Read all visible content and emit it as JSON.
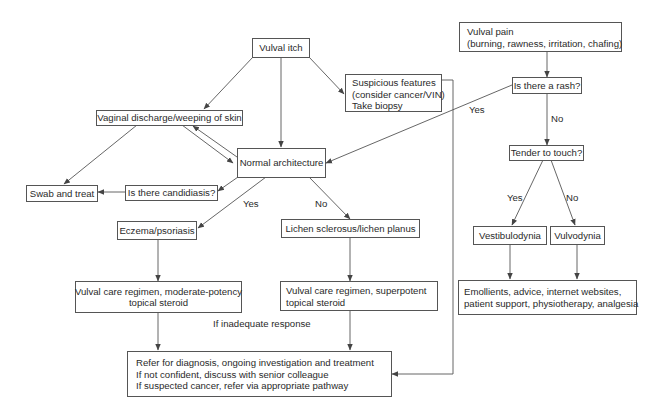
{
  "diagram": {
    "type": "flowchart",
    "nodes": {
      "vulval_itch": {
        "lines": [
          "Vulval itch"
        ]
      },
      "vaginal_discharge": {
        "lines": [
          "Vaginal discharge/weeping of skin"
        ]
      },
      "normal_architecture": {
        "lines": [
          "Normal architecture"
        ]
      },
      "swab_and_treat": {
        "lines": [
          "Swab and treat"
        ]
      },
      "candidiasis_question": {
        "lines": [
          "Is there candidiasis?"
        ]
      },
      "suspicious_features": {
        "lines": [
          "Suspicious features",
          "(consider cancer/VIN)",
          "Take biopsy"
        ]
      },
      "vulval_pain": {
        "lines": [
          "Vulval pain",
          "(burning, rawness, irritation, chafing)"
        ]
      },
      "rash_question": {
        "lines": [
          "Is there a rash?"
        ]
      },
      "tender_question": {
        "lines": [
          "Tender to touch?"
        ]
      },
      "eczema_psoriasis": {
        "lines": [
          "Eczema/psoriasis"
        ]
      },
      "lichen": {
        "lines": [
          "Lichen sclerosus/lichen planus"
        ]
      },
      "vestibulodynia": {
        "lines": [
          "Vestibulodynia"
        ]
      },
      "vulvodynia": {
        "lines": [
          "Vulvodynia"
        ]
      },
      "care_moderate": {
        "lines": [
          "Vulval care regimen, moderate-potency",
          "topical steroid"
        ]
      },
      "care_superpotent": {
        "lines": [
          "Vulval care regimen, superpotent",
          "topical steroid"
        ]
      },
      "emollients": {
        "lines": [
          "Emollients, advice, internet websites,",
          "patient support, physiotherapy, analgesia"
        ]
      },
      "refer": {
        "lines": [
          "Refer for diagnosis, ongoing investigation and treatment",
          "If not confident, discuss with senior colleague",
          "If suspected cancer, refer via appropriate pathway"
        ]
      }
    },
    "edge_labels": {
      "rash_yes": "Yes",
      "rash_no": "No",
      "tender_yes": "Yes",
      "tender_no": "No",
      "architecture_yes": "Yes",
      "architecture_no": "No",
      "inadequate_response": "If inadequate response"
    },
    "edges": [
      {
        "from": "vulval_itch",
        "to": "vaginal_discharge"
      },
      {
        "from": "vulval_itch",
        "to": "normal_architecture"
      },
      {
        "from": "vulval_itch",
        "to": "suspicious_features"
      },
      {
        "from": "vaginal_discharge",
        "to": "swab_and_treat"
      },
      {
        "from": "vaginal_discharge",
        "to": "normal_architecture"
      },
      {
        "from": "normal_architecture",
        "to": "vaginal_discharge"
      },
      {
        "from": "normal_architecture",
        "to": "candidiasis_question"
      },
      {
        "from": "candidiasis_question",
        "to": "swab_and_treat"
      },
      {
        "from": "normal_architecture",
        "to": "eczema_psoriasis",
        "label": "Yes"
      },
      {
        "from": "normal_architecture",
        "to": "lichen",
        "label": "No"
      },
      {
        "from": "eczema_psoriasis",
        "to": "care_moderate"
      },
      {
        "from": "lichen",
        "to": "care_superpotent"
      },
      {
        "from": "care_moderate",
        "to": "refer"
      },
      {
        "from": "care_superpotent",
        "to": "refer",
        "label": "If inadequate response"
      },
      {
        "from": "suspicious_features",
        "to": "refer"
      },
      {
        "from": "vulval_pain",
        "to": "rash_question"
      },
      {
        "from": "rash_question",
        "to": "normal_architecture",
        "label": "Yes"
      },
      {
        "from": "rash_question",
        "to": "tender_question",
        "label": "No"
      },
      {
        "from": "tender_question",
        "to": "vestibulodynia",
        "label": "Yes"
      },
      {
        "from": "tender_question",
        "to": "vulvodynia",
        "label": "No"
      },
      {
        "from": "vestibulodynia",
        "to": "emollients"
      },
      {
        "from": "vulvodynia",
        "to": "emollients"
      }
    ]
  },
  "colors": {
    "line": "#555555",
    "text": "#2a2a2a",
    "background": "#ffffff"
  }
}
